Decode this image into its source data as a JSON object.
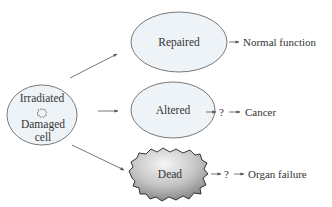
{
  "diagram": {
    "source": {
      "line1": "Irradiated",
      "line2": "Damaged",
      "line3": "cell",
      "icon": "starburst-damage-icon"
    },
    "outcomes": [
      {
        "label": "Repaired",
        "shape": "ellipse",
        "question": "",
        "result": "Normal function"
      },
      {
        "label": "Altered",
        "shape": "ellipse",
        "question": "?",
        "result": "Cancer"
      },
      {
        "label": "Dead",
        "shape": "irregular-blob",
        "question": "?",
        "result": "Organ failure"
      }
    ],
    "colors": {
      "ellipse_fill": "#eef3f8",
      "ellipse_stroke": "#6a6a6a",
      "dead_fill_light": "#f4f4f4",
      "dead_fill_dark": "#8a8a8a",
      "text": "#333333",
      "arrow": "#555555"
    }
  }
}
